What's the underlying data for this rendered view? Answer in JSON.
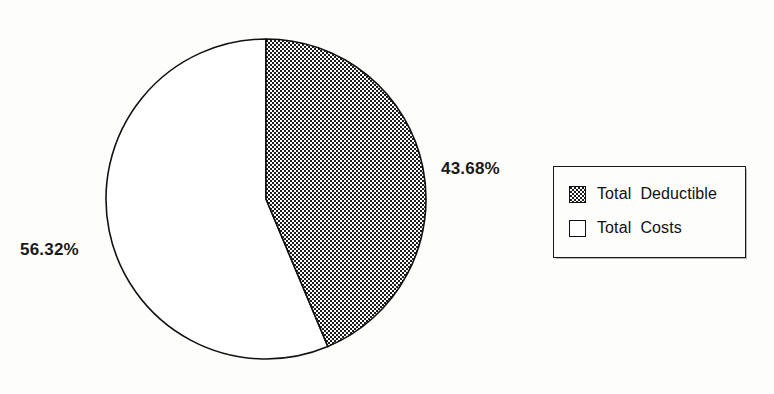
{
  "chart_data": {
    "type": "pie",
    "title": "",
    "subtitle": "",
    "xlabel": "",
    "ylabel": "",
    "grid": false,
    "legend_position": "right",
    "start_angle_deg": 0,
    "direction": "clockwise",
    "categories": [
      "Total Deductible",
      "Total Costs"
    ],
    "values": [
      43.68,
      56.32
    ],
    "value_unit": "%",
    "slices": [
      {
        "label": "Total Deductible",
        "value": 43.68,
        "value_text": "43.68%",
        "pattern": "crosshatch",
        "fill": "#1c1c1c",
        "stroke": "#111111"
      },
      {
        "label": "Total Costs",
        "value": 56.32,
        "value_text": "56.32%",
        "pattern": "solid",
        "fill": "#ffffff",
        "stroke": "#111111"
      }
    ],
    "annotations": [
      {
        "text": "43.68%",
        "target": "Total Deductible",
        "position": "right"
      },
      {
        "text": "56.32%",
        "target": "Total Costs",
        "position": "left"
      }
    ]
  },
  "labels": {
    "deductible_pct": "43.68%",
    "costs_pct": "56.32%"
  },
  "legend": {
    "items": [
      {
        "label": "Total  Deductible",
        "swatch": "crosshatch-swatch-icon"
      },
      {
        "label": "Total  Costs",
        "swatch": "empty-swatch-icon"
      }
    ]
  },
  "colors": {
    "background": "#fdfdfb",
    "ink": "#111111",
    "hatch_dark": "#1c1c1c",
    "hatch_light": "#ffffff",
    "slice_costs": "#ffffff"
  }
}
